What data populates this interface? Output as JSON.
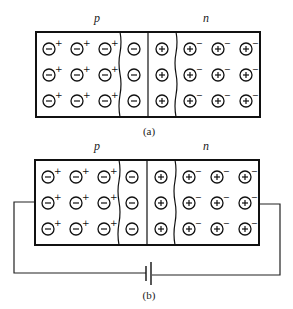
{
  "diagram": {
    "type": "pn-junction",
    "panels": [
      {
        "id": "a",
        "caption": "(a)",
        "region_labels": {
          "p": "p",
          "n": "n"
        },
        "p_region": {
          "rows": 3,
          "cols": 3,
          "ion": "−",
          "carrier": "+"
        },
        "depletion_p_side": {
          "rows": 3,
          "ion": "−"
        },
        "depletion_n_side": {
          "rows": 3,
          "ion": "+"
        },
        "n_region": {
          "rows": 3,
          "cols": 3,
          "ion": "+",
          "carrier": "−"
        },
        "circuit": null
      },
      {
        "id": "b",
        "caption": "(b)",
        "region_labels": {
          "p": "p",
          "n": "n"
        },
        "p_region": {
          "rows": 3,
          "cols": 3,
          "ion": "−",
          "carrier": "+"
        },
        "depletion_p_side": {
          "rows": 3,
          "ion": "−"
        },
        "depletion_n_side": {
          "rows": 3,
          "ion": "+"
        },
        "n_region": {
          "rows": 3,
          "cols": 3,
          "ion": "+",
          "carrier": "−"
        },
        "circuit": {
          "element": "battery",
          "connects": [
            "p-side",
            "n-side"
          ]
        }
      }
    ]
  }
}
